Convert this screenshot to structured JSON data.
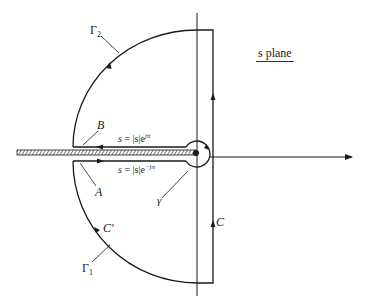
{
  "diagram": {
    "plane_label": "s plane",
    "labels": {
      "gamma2": "Γ",
      "gamma2_sub": "2",
      "gamma1": "Γ",
      "gamma1_sub": "1",
      "B": "B",
      "A": "A",
      "C_prime": "C′",
      "C": "C",
      "small_gamma": "γ"
    },
    "equations": {
      "upper_s": "s",
      "upper_rest": " = |s|e",
      "upper_exp": "jπ",
      "lower_s": "s",
      "lower_rest": " = |s|e",
      "lower_exp": "−jπ"
    },
    "colors": {
      "line": "#1a1a1a",
      "background": "#ffffff"
    }
  }
}
